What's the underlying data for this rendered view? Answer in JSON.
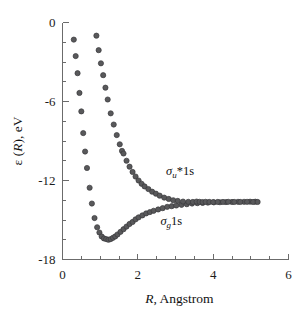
{
  "chart_data": {
    "type": "scatter",
    "title": "",
    "subtitle": "",
    "xlabel": "R, Angstrom",
    "ylabel": "ε (R), eV",
    "xlim": [
      0,
      6
    ],
    "ylim": [
      -18,
      0
    ],
    "grid": false,
    "legend_position": "inline-annotations",
    "x_ticks_major": [
      0,
      2,
      4,
      6
    ],
    "x_ticklabels": [
      "0",
      "2",
      "4",
      "6"
    ],
    "x_ticks_minor": [
      0.5,
      1,
      1.5,
      2.5,
      3,
      3.5,
      4.5,
      5,
      5.5
    ],
    "y_ticks_major": [
      0,
      -6,
      -12,
      -18
    ],
    "y_ticklabels": [
      "0",
      "-6",
      "-12",
      "-18"
    ],
    "y_ticks_minor": [
      -1.5,
      -3,
      -4.5,
      -7.5,
      -9,
      -10.5,
      -13.5,
      -15,
      -16.5
    ],
    "asymptote": -13.6,
    "annotations": [
      {
        "id": "sigma-u-star",
        "text_plain": "σu*1s",
        "sigma": "σ",
        "sub": "u",
        "rest": "*1s",
        "x": 2.75,
        "y": -11.55
      },
      {
        "id": "sigma-g",
        "text_plain": "σg1s",
        "sigma": "σ",
        "sub": "g",
        "rest": "1s",
        "x": 2.6,
        "y": -15.35
      }
    ],
    "series": [
      {
        "name": "σg1s",
        "marker": "circle",
        "color": "#59595b",
        "points": [
          [
            0.3,
            -1.3
          ],
          [
            0.35,
            -2.55
          ],
          [
            0.4,
            -3.85
          ],
          [
            0.45,
            -5.35
          ],
          [
            0.5,
            -6.75
          ],
          [
            0.55,
            -8.4
          ],
          [
            0.6,
            -9.8
          ],
          [
            0.65,
            -11.05
          ],
          [
            0.72,
            -12.55
          ],
          [
            0.78,
            -13.75
          ],
          [
            0.85,
            -14.85
          ],
          [
            0.92,
            -15.55
          ],
          [
            0.98,
            -15.95
          ],
          [
            1.04,
            -16.25
          ],
          [
            1.1,
            -16.4
          ],
          [
            1.16,
            -16.45
          ],
          [
            1.22,
            -16.5
          ],
          [
            1.28,
            -16.45
          ],
          [
            1.34,
            -16.35
          ],
          [
            1.4,
            -16.25
          ],
          [
            1.46,
            -16.1
          ],
          [
            1.54,
            -15.9
          ],
          [
            1.62,
            -15.7
          ],
          [
            1.7,
            -15.5
          ],
          [
            1.78,
            -15.3
          ],
          [
            1.86,
            -15.15
          ],
          [
            1.94,
            -14.95
          ],
          [
            2.02,
            -14.8
          ],
          [
            2.12,
            -14.65
          ],
          [
            2.22,
            -14.5
          ],
          [
            2.32,
            -14.4
          ],
          [
            2.42,
            -14.3
          ],
          [
            2.54,
            -14.2
          ],
          [
            2.66,
            -14.1
          ],
          [
            2.78,
            -14.0
          ],
          [
            2.9,
            -13.95
          ],
          [
            3.02,
            -13.9
          ],
          [
            3.16,
            -13.85
          ],
          [
            3.3,
            -13.8
          ],
          [
            3.44,
            -13.75
          ],
          [
            3.58,
            -13.72
          ],
          [
            3.72,
            -13.7
          ],
          [
            3.86,
            -13.68
          ],
          [
            4.02,
            -13.66
          ],
          [
            4.18,
            -13.65
          ],
          [
            4.34,
            -13.64
          ],
          [
            4.5,
            -13.63
          ],
          [
            4.66,
            -13.62
          ],
          [
            4.82,
            -13.62
          ],
          [
            4.98,
            -13.61
          ],
          [
            5.12,
            -13.61
          ]
        ]
      },
      {
        "name": "σu*1s",
        "marker": "circle",
        "color": "#59595b",
        "points": [
          [
            0.9,
            -1.0
          ],
          [
            0.96,
            -2.1
          ],
          [
            1.02,
            -3.1
          ],
          [
            1.08,
            -4.0
          ],
          [
            1.14,
            -4.95
          ],
          [
            1.2,
            -5.85
          ],
          [
            1.28,
            -6.9
          ],
          [
            1.36,
            -7.75
          ],
          [
            1.44,
            -8.55
          ],
          [
            1.52,
            -9.25
          ],
          [
            1.58,
            -9.75
          ],
          [
            1.62,
            -9.95
          ],
          [
            1.7,
            -10.5
          ],
          [
            1.78,
            -10.95
          ],
          [
            1.86,
            -11.35
          ],
          [
            1.94,
            -11.7
          ],
          [
            2.02,
            -12.0
          ],
          [
            2.1,
            -12.25
          ],
          [
            2.18,
            -12.45
          ],
          [
            2.28,
            -12.65
          ],
          [
            2.38,
            -12.85
          ],
          [
            2.48,
            -13.0
          ],
          [
            2.58,
            -13.15
          ],
          [
            2.7,
            -13.3
          ],
          [
            2.82,
            -13.4
          ],
          [
            2.94,
            -13.5
          ],
          [
            3.06,
            -13.55
          ],
          [
            3.2,
            -13.6
          ],
          [
            3.34,
            -13.62
          ],
          [
            3.46,
            -13.63
          ],
          [
            3.56,
            -13.6
          ],
          [
            3.64,
            -13.62
          ],
          [
            3.72,
            -13.64
          ],
          [
            3.8,
            -13.62
          ],
          [
            3.9,
            -13.63
          ],
          [
            4.0,
            -13.64
          ],
          [
            4.12,
            -13.63
          ],
          [
            4.26,
            -13.63
          ],
          [
            4.4,
            -13.62
          ],
          [
            4.56,
            -13.63
          ],
          [
            4.72,
            -13.63
          ],
          [
            4.9,
            -13.62
          ],
          [
            5.06,
            -13.63
          ],
          [
            5.18,
            -13.63
          ]
        ]
      }
    ]
  }
}
